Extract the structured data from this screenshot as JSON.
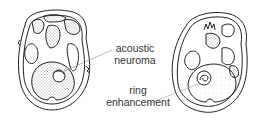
{
  "figure": {
    "panels": [
      {
        "id": "left",
        "description": "axial skull section with acoustic neuroma"
      },
      {
        "id": "right",
        "description": "axial skull section with ring enhancement"
      }
    ],
    "labels": [
      {
        "id": "acoustic-neuroma",
        "line1": "acoustic",
        "line2": "neuroma"
      },
      {
        "id": "ring-enhancement",
        "line1": "ring",
        "line2": "enhancement"
      }
    ],
    "colors": {
      "ink": "#222222",
      "leader": "#999999",
      "text": "#333333"
    }
  }
}
